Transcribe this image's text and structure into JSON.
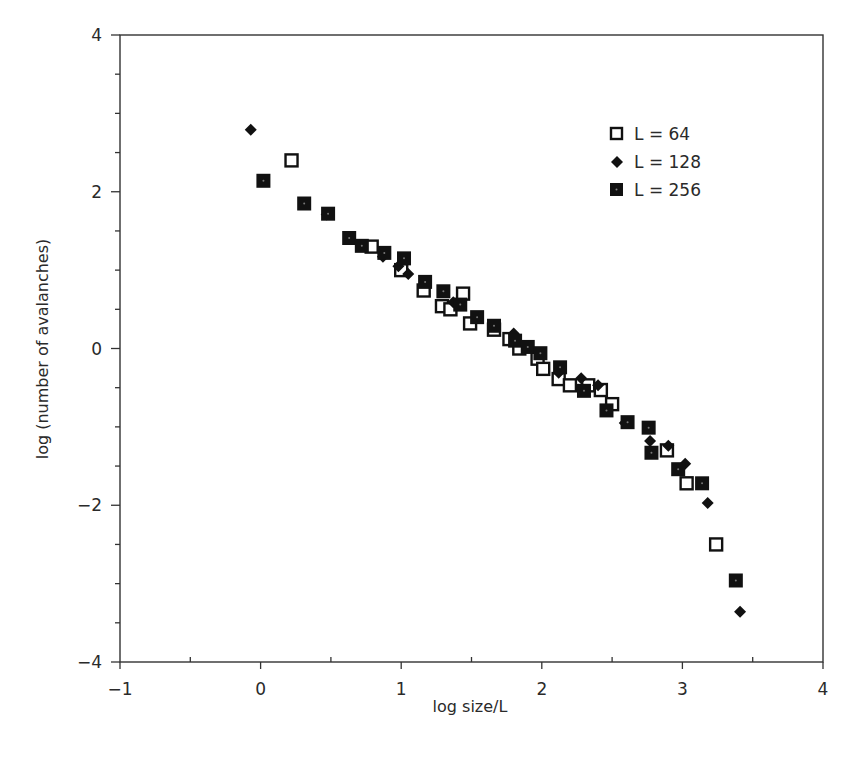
{
  "chart_data": {
    "type": "scatter",
    "title": "",
    "xlabel": "log size/L",
    "ylabel": "log (number of avalanches)",
    "xlim": [
      -1,
      4
    ],
    "ylim": [
      -4,
      4
    ],
    "x_ticks": [
      -1,
      0,
      1,
      2,
      3,
      4
    ],
    "y_ticks": [
      -4,
      -2,
      0,
      2,
      4
    ],
    "x_tick_labels": [
      "−1",
      "0",
      "1",
      "2",
      "3",
      "4"
    ],
    "y_tick_labels": [
      "−4",
      "−2",
      "0",
      "2",
      "4"
    ],
    "x_minor_step": 0.5,
    "y_minor_step": 0.5,
    "grid": false,
    "legend_position": "upper right",
    "series": [
      {
        "name": "L = 64",
        "marker": "open-square",
        "x": [
          0.22,
          0.79,
          1.0,
          1.16,
          1.29,
          1.35,
          1.44,
          1.49,
          1.66,
          1.77,
          1.84,
          1.97,
          2.01,
          2.12,
          2.2,
          2.33,
          2.42,
          2.5,
          2.89,
          3.03,
          3.24
        ],
        "y": [
          2.4,
          1.3,
          1.0,
          0.74,
          0.54,
          0.5,
          0.7,
          0.32,
          0.24,
          0.12,
          0.0,
          -0.13,
          -0.26,
          -0.39,
          -0.47,
          -0.47,
          -0.53,
          -0.71,
          -1.3,
          -1.72,
          -2.5
        ]
      },
      {
        "name": "L = 128",
        "marker": "filled-diamond",
        "x": [
          -0.07,
          0.47,
          0.87,
          0.98,
          1.05,
          1.37,
          1.8,
          2.12,
          2.28,
          2.4,
          2.59,
          2.77,
          2.9,
          3.02,
          3.18,
          3.41
        ],
        "y": [
          2.79,
          1.71,
          1.17,
          1.05,
          0.95,
          0.59,
          0.19,
          -0.31,
          -0.38,
          -0.47,
          -0.95,
          -1.18,
          -1.24,
          -1.47,
          -1.97,
          -3.36
        ]
      },
      {
        "name": "L = 256",
        "marker": "filled-square-dot",
        "x": [
          0.02,
          0.31,
          0.48,
          0.63,
          0.72,
          0.88,
          1.02,
          1.17,
          1.3,
          1.42,
          1.54,
          1.66,
          1.81,
          1.9,
          1.99,
          2.13,
          2.3,
          2.46,
          2.61,
          2.76,
          2.78,
          2.97,
          3.14,
          3.38
        ],
        "y": [
          2.14,
          1.85,
          1.72,
          1.41,
          1.31,
          1.22,
          1.15,
          0.85,
          0.73,
          0.56,
          0.4,
          0.29,
          0.1,
          0.02,
          -0.06,
          -0.24,
          -0.54,
          -0.79,
          -0.94,
          -1.01,
          -1.33,
          -1.54,
          -1.72,
          -2.96
        ]
      }
    ]
  },
  "legend": {
    "items": [
      {
        "label": "L = 64"
      },
      {
        "label": "L = 128"
      },
      {
        "label": "L = 256"
      }
    ]
  }
}
